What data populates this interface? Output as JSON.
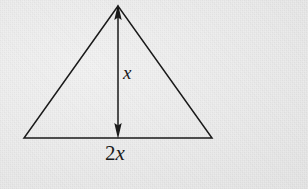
{
  "figure": {
    "name": "isosceles-triangle-with-height-and-base-labels",
    "background_color": "#ebebeb",
    "stroke_color": "#1a1a1a",
    "canvas": {
      "width": 308,
      "height": 189
    },
    "shape": {
      "type": "triangle",
      "apex": {
        "x": 118,
        "y": 5
      },
      "bottom_left": {
        "x": 24,
        "y": 138
      },
      "bottom_right": {
        "x": 212,
        "y": 138
      }
    },
    "height_arrow": {
      "type": "double-headed-vertical-arrow",
      "x": 118,
      "y_top": 5,
      "y_bottom": 138
    },
    "labels": {
      "height": {
        "number": "",
        "variable": "x",
        "full_text": "x"
      },
      "base": {
        "number": "2",
        "variable": "x",
        "full_text": "2x"
      }
    }
  }
}
